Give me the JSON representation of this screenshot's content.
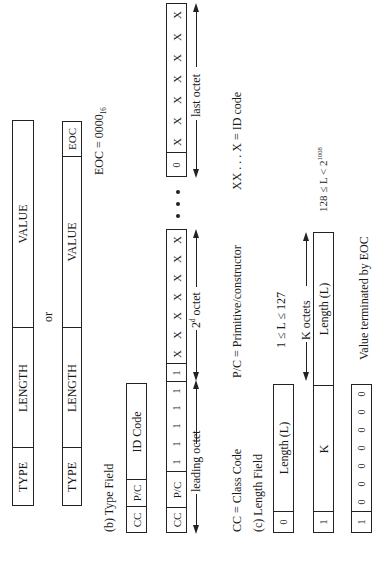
{
  "section_a": {
    "row1": {
      "type": "TYPE",
      "length": "LENGTH",
      "value": "VALUE"
    },
    "or_label": "or",
    "row2": {
      "type": "TYPE",
      "length": "LENGTH",
      "value": "VALUE",
      "eoc": "EOC"
    },
    "eoc_note": {
      "prefix": "EOC = 0000",
      "sub": "16"
    }
  },
  "section_b": {
    "title": "(b) Type Field",
    "short_form": {
      "cc": "CC",
      "pc": "P/C",
      "id": "ID Code"
    },
    "long_form": {
      "cc": "CC",
      "pc": "P/C",
      "leading_ones": [
        "1",
        "1",
        "1",
        "1",
        "1"
      ],
      "second_octet": [
        "1",
        "X",
        "X",
        "X",
        "X",
        "X",
        "X",
        "X"
      ],
      "ellipsis": "• • •",
      "last_octet": [
        "0",
        "X",
        "X",
        "X",
        "X",
        "X",
        "X",
        "X"
      ]
    },
    "labels": {
      "leading_octet": "leading octet",
      "second_octet_prefix": "2",
      "second_octet_sup": "d",
      "second_octet_suffix": " octet",
      "last_octet": "last octet"
    },
    "legend": {
      "cc": "CC = Class Code",
      "pc": "P/C = Primitive/constructor",
      "xx": "XX . . . X = ID code"
    }
  },
  "section_c": {
    "title": "(c) Length Field",
    "short": {
      "bit": "0",
      "field": "Length (L)",
      "range": "1 ≤ L ≤ 127"
    },
    "long": {
      "bit": "1",
      "k": "K",
      "field": "Length (L)",
      "k_octets": "K octets",
      "range_prefix": "128 ≤ L < 2",
      "range_sup": "1008"
    },
    "indefinite": {
      "bits": [
        "1",
        "0",
        "0",
        "0",
        "0",
        "0",
        "0",
        "0"
      ],
      "note": "Value terminated by EOC"
    }
  }
}
